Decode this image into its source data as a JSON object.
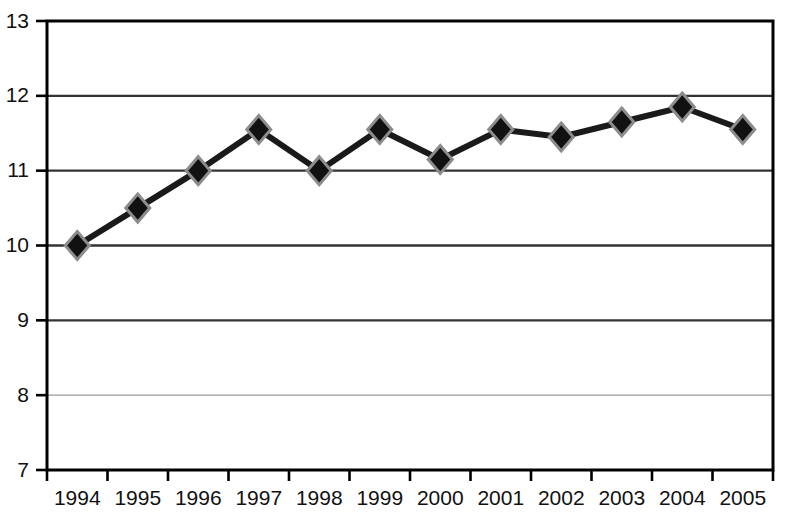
{
  "chart_data": {
    "type": "line",
    "title": "",
    "subtitle": "",
    "xlabel": "",
    "ylabel": "",
    "categories": [
      "1994",
      "1995",
      "1996",
      "1997",
      "1998",
      "1999",
      "2000",
      "2001",
      "2002",
      "2003",
      "2004",
      "2005"
    ],
    "values": [
      10.0,
      10.5,
      11.0,
      11.55,
      11.0,
      11.55,
      11.15,
      11.55,
      11.45,
      11.65,
      11.85,
      11.55
    ],
    "series": [
      {
        "name": "series-1",
        "values": [
          10.0,
          10.5,
          11.0,
          11.55,
          11.0,
          11.55,
          11.15,
          11.55,
          11.45,
          11.65,
          11.85,
          11.55
        ]
      }
    ],
    "ylim": [
      7,
      13
    ],
    "ytick_labels": [
      "13",
      "12",
      "11",
      "10",
      "9",
      "8",
      "7"
    ],
    "ytick_values": [
      13,
      12,
      11,
      10,
      9,
      8,
      7
    ],
    "xtick_labels": [
      "1994",
      "1995",
      "1996",
      "1997",
      "1998",
      "1999",
      "2000",
      "2001",
      "2002",
      "2003",
      "2004",
      "2005"
    ],
    "grid": true,
    "grid_axis": "y",
    "legend": false,
    "legend_position": "none",
    "annotations": [],
    "colors": {
      "line": "#1a1a1a",
      "marker_fill": "#111111",
      "marker_edge": "#8c8c8c",
      "gridline": "#333333",
      "gridline_light": "#9a9a9a",
      "axis": "#000000",
      "tick_text": "#111111",
      "background": "#ffffff"
    },
    "marker_shape": "diamond",
    "line_width": 6
  }
}
